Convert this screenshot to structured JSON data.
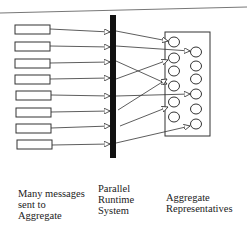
{
  "diagram": {
    "colors": {
      "stroke": "#333333",
      "bar": "#111111",
      "topline": "#777777"
    },
    "labels": {
      "senders": "Many messages\nsent to\nAggregate",
      "runtime": "Parallel\nRuntime\nSystem",
      "representatives": "Aggregate\nRepresentatives"
    },
    "senders_count": 8,
    "representatives_count": 12
  }
}
